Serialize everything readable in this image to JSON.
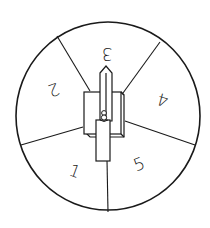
{
  "spinner": {
    "title": "Spinner wheel",
    "stroke_color": "#1a1a1a",
    "background_color": "#ffffff",
    "sections": [
      {
        "label": "3",
        "position": "top",
        "rotation": 180
      },
      {
        "label": "4",
        "position": "right",
        "rotation": 180
      },
      {
        "label": "5",
        "position": "bottom-right",
        "rotation": 0
      },
      {
        "label": "1",
        "position": "bottom-left",
        "rotation": 0
      },
      {
        "label": "2",
        "position": "left",
        "rotation": 180
      }
    ],
    "pointer": {
      "orientation": "up",
      "description": "arrow pointer on center pivot"
    }
  }
}
